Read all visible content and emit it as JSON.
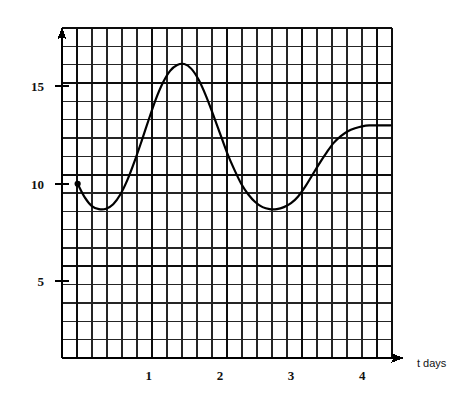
{
  "chart_data": {
    "type": "line",
    "title": "",
    "subtitle": "",
    "xlabel": "t days",
    "ylabel": "",
    "xlim": [
      -0.22,
      4.42
    ],
    "ylim": [
      1.05,
      18.0
    ],
    "grid": true,
    "grid_minor": true,
    "legend": false,
    "legend_position": "none",
    "annotations": [],
    "x_ticks": [
      {
        "value": 1,
        "label": "1"
      },
      {
        "value": 2,
        "label": "2"
      },
      {
        "value": 3,
        "label": "3"
      },
      {
        "value": 4,
        "label": "4"
      }
    ],
    "y_ticks": [
      {
        "value": 5,
        "label": "5"
      },
      {
        "value": 10,
        "label": "10"
      },
      {
        "value": 15,
        "label": "15"
      }
    ],
    "series": [
      {
        "name": "",
        "color": "#000000",
        "start_marker": true,
        "x": [
          0.0,
          0.1,
          0.2,
          0.3,
          0.4,
          0.5,
          0.6,
          0.7,
          0.8,
          0.9,
          1.0,
          1.1,
          1.2,
          1.3,
          1.4,
          1.5,
          1.6,
          1.7,
          1.8,
          1.9,
          2.0,
          2.1,
          2.2,
          2.3,
          2.4,
          2.5,
          2.6,
          2.7,
          2.8,
          2.9,
          3.0,
          3.1,
          3.2,
          3.3,
          3.4,
          3.5,
          3.6,
          3.7,
          3.8,
          3.9,
          4.0,
          4.1,
          4.2,
          4.3,
          4.4
        ],
        "values": [
          10.0,
          9.3,
          8.85,
          8.7,
          8.72,
          8.95,
          9.45,
          10.2,
          11.15,
          12.2,
          13.3,
          14.35,
          15.2,
          15.8,
          16.1,
          16.15,
          15.9,
          15.35,
          14.55,
          13.6,
          12.6,
          11.6,
          10.75,
          10.0,
          9.45,
          9.05,
          8.8,
          8.7,
          8.7,
          8.8,
          9.0,
          9.35,
          9.85,
          10.45,
          11.05,
          11.6,
          12.1,
          12.45,
          12.7,
          12.85,
          12.95,
          13.0,
          13.0,
          13.0,
          13.0
        ]
      }
    ],
    "key_points": {
      "start": {
        "t": 0,
        "value": 10
      },
      "first_minimum": {
        "t": 0.32,
        "value": 8.7
      },
      "maximum": {
        "t": 1.5,
        "value": 16.15
      },
      "second_minimum": {
        "t": 2.75,
        "value": 8.7
      },
      "end": {
        "t": 4.4,
        "value": 13.0
      }
    }
  },
  "axes": {
    "x_axis_label": "t days",
    "y_axis_label": ""
  }
}
